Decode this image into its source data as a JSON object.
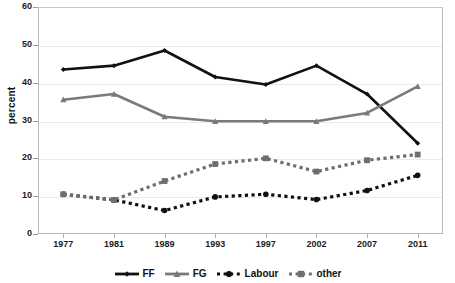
{
  "chart_data": {
    "type": "line",
    "title": "",
    "xlabel": "",
    "ylabel": "percent",
    "categories": [
      "1977",
      "1981",
      "1989",
      "1993",
      "1997",
      "2002",
      "2007",
      "2011"
    ],
    "ylim": [
      0,
      60
    ],
    "ytick_values": [
      "0",
      "10",
      "20",
      "30",
      "40",
      "50",
      "60"
    ],
    "grid": "horizontal",
    "legend_position": "bottom",
    "series": [
      {
        "name": "FF",
        "color": "#111111",
        "style": "solid",
        "marker": "diamond",
        "values": [
          43.5,
          44.5,
          48.5,
          41.5,
          39.5,
          44.5,
          37.0,
          24.0
        ]
      },
      {
        "name": "FG",
        "color": "#7a7a7a",
        "style": "solid",
        "marker": "triangle",
        "values": [
          35.5,
          37.0,
          31.0,
          29.8,
          29.8,
          29.8,
          32.0,
          39.0
        ]
      },
      {
        "name": "Labour",
        "color": "#111111",
        "style": "dotted",
        "marker": "circle",
        "values": [
          10.5,
          9.0,
          6.2,
          9.8,
          10.5,
          9.1,
          11.5,
          15.5
        ]
      },
      {
        "name": "other",
        "color": "#6e6e6e",
        "style": "dotted",
        "marker": "square",
        "values": [
          10.5,
          9.0,
          14.0,
          18.5,
          20.0,
          16.5,
          19.5,
          21.0
        ]
      }
    ]
  },
  "axis": {
    "y_label": "percent",
    "y_ticks": [
      "60",
      "50",
      "40",
      "30",
      "20",
      "10",
      "0"
    ],
    "x_ticks": [
      "1977",
      "1981",
      "1989",
      "1993",
      "1997",
      "2002",
      "2007",
      "2011"
    ]
  },
  "legend": {
    "items": [
      {
        "label": "FF"
      },
      {
        "label": "FG"
      },
      {
        "label": "Labour"
      },
      {
        "label": "other"
      }
    ]
  }
}
